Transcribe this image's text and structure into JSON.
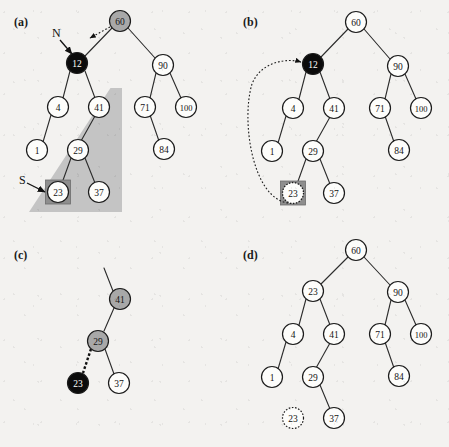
{
  "figure": {
    "background_color": "#f3f2f0",
    "node_radius": 10.5,
    "colors": {
      "node_white": "#fdfdfb",
      "node_gray": "#a8a8a8",
      "node_black": "#0b0b0b",
      "text_on_dark": "#ffffff",
      "text_on_light": "#141414",
      "edge": "#2b2b2b",
      "wedge_gray": "#c4c4c4",
      "highlight_box": "#8e8e8e"
    }
  },
  "panels": [
    {
      "id": "a",
      "label": "(a)",
      "label_pos": {
        "x": 14,
        "y": 26
      },
      "pointer_labels": [
        {
          "name": "N",
          "text": "N",
          "x": 52,
          "y": 37
        },
        {
          "name": "S",
          "text": "S",
          "x": 19,
          "y": 184
        }
      ],
      "nodes": [
        {
          "name": "node-60",
          "value": "60",
          "x": 120,
          "y": 21,
          "fill": "gray",
          "text": "light"
        },
        {
          "name": "node-12",
          "value": "12",
          "x": 77,
          "y": 63,
          "fill": "black",
          "text": "dark"
        },
        {
          "name": "node-90",
          "value": "90",
          "x": 163,
          "y": 65,
          "fill": "white",
          "text": "light"
        },
        {
          "name": "node-4",
          "value": "4",
          "x": 58,
          "y": 107,
          "fill": "white",
          "text": "light"
        },
        {
          "name": "node-41",
          "value": "41",
          "x": 99,
          "y": 107,
          "fill": "white",
          "text": "light"
        },
        {
          "name": "node-71",
          "value": "71",
          "x": 145,
          "y": 107,
          "fill": "white",
          "text": "light"
        },
        {
          "name": "node-100",
          "value": "100",
          "x": 186,
          "y": 107,
          "fill": "white",
          "text": "light"
        },
        {
          "name": "node-1",
          "value": "1",
          "x": 37,
          "y": 150,
          "fill": "white",
          "text": "light"
        },
        {
          "name": "node-29",
          "value": "29",
          "x": 78,
          "y": 150,
          "fill": "white",
          "text": "light"
        },
        {
          "name": "node-84",
          "value": "84",
          "x": 164,
          "y": 149,
          "fill": "white",
          "text": "light"
        },
        {
          "name": "node-23",
          "value": "23",
          "x": 58,
          "y": 192,
          "fill": "white",
          "text": "light",
          "boxed": true
        },
        {
          "name": "node-37",
          "value": "37",
          "x": 99,
          "y": 192,
          "fill": "white",
          "text": "light"
        }
      ],
      "edges": [
        [
          "node-60",
          "node-12"
        ],
        [
          "node-60",
          "node-90"
        ],
        [
          "node-12",
          "node-4"
        ],
        [
          "node-12",
          "node-41"
        ],
        [
          "node-90",
          "node-71"
        ],
        [
          "node-90",
          "node-100"
        ],
        [
          "node-4",
          "node-1"
        ],
        [
          "node-41",
          "node-29"
        ],
        [
          "node-71",
          "node-84"
        ],
        [
          "node-29",
          "node-23"
        ],
        [
          "node-29",
          "node-37"
        ]
      ],
      "shaded_subtree_root": "node-41"
    },
    {
      "id": "b",
      "label": "(b)",
      "label_pos": {
        "x": 243,
        "y": 26
      },
      "pointer_labels": [],
      "nodes": [
        {
          "name": "node-60",
          "value": "60",
          "x": 356,
          "y": 22,
          "fill": "white",
          "text": "light"
        },
        {
          "name": "node-12",
          "value": "12",
          "x": 313,
          "y": 64,
          "fill": "black",
          "text": "dark"
        },
        {
          "name": "node-90",
          "value": "90",
          "x": 398,
          "y": 66,
          "fill": "white",
          "text": "light"
        },
        {
          "name": "node-4",
          "value": "4",
          "x": 293,
          "y": 108,
          "fill": "white",
          "text": "light"
        },
        {
          "name": "node-41",
          "value": "41",
          "x": 334,
          "y": 108,
          "fill": "white",
          "text": "light"
        },
        {
          "name": "node-71",
          "value": "71",
          "x": 380,
          "y": 108,
          "fill": "white",
          "text": "light"
        },
        {
          "name": "node-100",
          "value": "100",
          "x": 421,
          "y": 108,
          "fill": "white",
          "text": "light"
        },
        {
          "name": "node-1",
          "value": "1",
          "x": 272,
          "y": 151,
          "fill": "white",
          "text": "light"
        },
        {
          "name": "node-29",
          "value": "29",
          "x": 313,
          "y": 151,
          "fill": "white",
          "text": "light"
        },
        {
          "name": "node-84",
          "value": "84",
          "x": 399,
          "y": 150,
          "fill": "white",
          "text": "light"
        },
        {
          "name": "node-23",
          "value": "23",
          "x": 293,
          "y": 193,
          "fill": "white",
          "text": "light",
          "boxed": true,
          "dashed_ring": true
        },
        {
          "name": "node-37",
          "value": "37",
          "x": 334,
          "y": 193,
          "fill": "white",
          "text": "light"
        }
      ],
      "edges": [
        [
          "node-60",
          "node-12"
        ],
        [
          "node-60",
          "node-90"
        ],
        [
          "node-12",
          "node-4"
        ],
        [
          "node-12",
          "node-41"
        ],
        [
          "node-90",
          "node-71"
        ],
        [
          "node-90",
          "node-100"
        ],
        [
          "node-4",
          "node-1"
        ],
        [
          "node-41",
          "node-29"
        ],
        [
          "node-71",
          "node-84"
        ],
        [
          "node-29",
          "node-23"
        ],
        [
          "node-29",
          "node-37"
        ]
      ],
      "copy_arrow": {
        "from": "node-23",
        "to": "node-12",
        "style": "dotted-curve"
      }
    },
    {
      "id": "c",
      "label": "(c)",
      "label_pos": {
        "x": 14,
        "y": 259
      },
      "pointer_labels": [],
      "nodes": [
        {
          "name": "node-41",
          "value": "41",
          "x": 120,
          "y": 299,
          "fill": "gray",
          "text": "light"
        },
        {
          "name": "node-29",
          "value": "29",
          "x": 98,
          "y": 341,
          "fill": "gray",
          "text": "light"
        },
        {
          "name": "node-23",
          "value": "23",
          "x": 78,
          "y": 383,
          "fill": "black",
          "text": "dark"
        },
        {
          "name": "node-37",
          "value": "37",
          "x": 119,
          "y": 383,
          "fill": "white",
          "text": "light"
        }
      ],
      "edges": [
        [
          "node-41",
          "node-29"
        ],
        [
          "node-29",
          "node-37"
        ]
      ],
      "stub_edge": {
        "from": "node-41",
        "to_x": 104,
        "to_y": 268
      },
      "detach_edge": {
        "from": "node-29",
        "to": "node-23",
        "style": "thick-dashed"
      }
    },
    {
      "id": "d",
      "label": "(d)",
      "label_pos": {
        "x": 243,
        "y": 259
      },
      "pointer_labels": [],
      "nodes": [
        {
          "name": "node-60",
          "value": "60",
          "x": 356,
          "y": 250,
          "fill": "white",
          "text": "light"
        },
        {
          "name": "node-23r",
          "value": "23",
          "x": 313,
          "y": 291,
          "fill": "white",
          "text": "light"
        },
        {
          "name": "node-90",
          "value": "90",
          "x": 398,
          "y": 292,
          "fill": "white",
          "text": "light"
        },
        {
          "name": "node-4",
          "value": "4",
          "x": 293,
          "y": 334,
          "fill": "white",
          "text": "light"
        },
        {
          "name": "node-41",
          "value": "41",
          "x": 334,
          "y": 334,
          "fill": "white",
          "text": "light"
        },
        {
          "name": "node-71",
          "value": "71",
          "x": 380,
          "y": 334,
          "fill": "white",
          "text": "light"
        },
        {
          "name": "node-100",
          "value": "100",
          "x": 421,
          "y": 334,
          "fill": "white",
          "text": "light"
        },
        {
          "name": "node-1",
          "value": "1",
          "x": 272,
          "y": 377,
          "fill": "white",
          "text": "light"
        },
        {
          "name": "node-29",
          "value": "29",
          "x": 313,
          "y": 377,
          "fill": "white",
          "text": "light"
        },
        {
          "name": "node-84",
          "value": "84",
          "x": 399,
          "y": 376,
          "fill": "white",
          "text": "light"
        },
        {
          "name": "node-23d",
          "value": "23",
          "x": 293,
          "y": 418,
          "fill": "white",
          "text": "light",
          "dashed_ring": true,
          "detached": true
        },
        {
          "name": "node-37",
          "value": "37",
          "x": 334,
          "y": 418,
          "fill": "white",
          "text": "light"
        }
      ],
      "edges": [
        [
          "node-60",
          "node-23r"
        ],
        [
          "node-60",
          "node-90"
        ],
        [
          "node-23r",
          "node-4"
        ],
        [
          "node-23r",
          "node-41"
        ],
        [
          "node-90",
          "node-71"
        ],
        [
          "node-90",
          "node-100"
        ],
        [
          "node-4",
          "node-1"
        ],
        [
          "node-41",
          "node-29"
        ],
        [
          "node-71",
          "node-84"
        ],
        [
          "node-29",
          "node-37"
        ]
      ]
    }
  ]
}
